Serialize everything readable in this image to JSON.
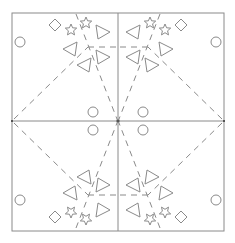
{
  "diagram": {
    "title": "",
    "stroke_color": "#8a8a8a",
    "background": "#ffffff",
    "frame": {
      "x": 12,
      "y": 13,
      "width": 212,
      "height": 218
    },
    "center": {
      "x": 118,
      "y": 121
    },
    "symmetry": "four-fold mirror (horizontal and vertical)",
    "quadrant_template": {
      "circles": [
        {
          "cx": 20,
          "cy": 42,
          "r": 5
        },
        {
          "cx": 93,
          "cy": 112,
          "r": 5
        }
      ],
      "diamonds": [
        {
          "cx": 55,
          "cy": 25,
          "size": 6
        }
      ],
      "stars": [
        {
          "cx": 71,
          "cy": 30,
          "r": 6
        },
        {
          "cx": 86,
          "cy": 23,
          "r": 6
        }
      ],
      "triangles": [
        {
          "cx": 70,
          "cy": 49,
          "direction": "left"
        },
        {
          "cx": 103,
          "cy": 32,
          "direction": "right"
        },
        {
          "cx": 84,
          "cy": 65,
          "direction": "left"
        },
        {
          "cx": 103,
          "cy": 57,
          "direction": "right"
        }
      ],
      "dashed_lines": [
        {
          "x1": 76,
          "y1": 14,
          "x2": 117,
          "y2": 119
        },
        {
          "x1": 88,
          "y1": 47,
          "x2": 118,
          "y2": 47
        },
        {
          "x1": 14,
          "y1": 119,
          "x2": 88,
          "y2": 47
        }
      ]
    },
    "quadrants": [
      "top-left",
      "top-right",
      "bottom-left",
      "bottom-right"
    ],
    "icons": [
      "circle-icon",
      "diamond-icon",
      "star-icon",
      "triangle-icon"
    ]
  }
}
